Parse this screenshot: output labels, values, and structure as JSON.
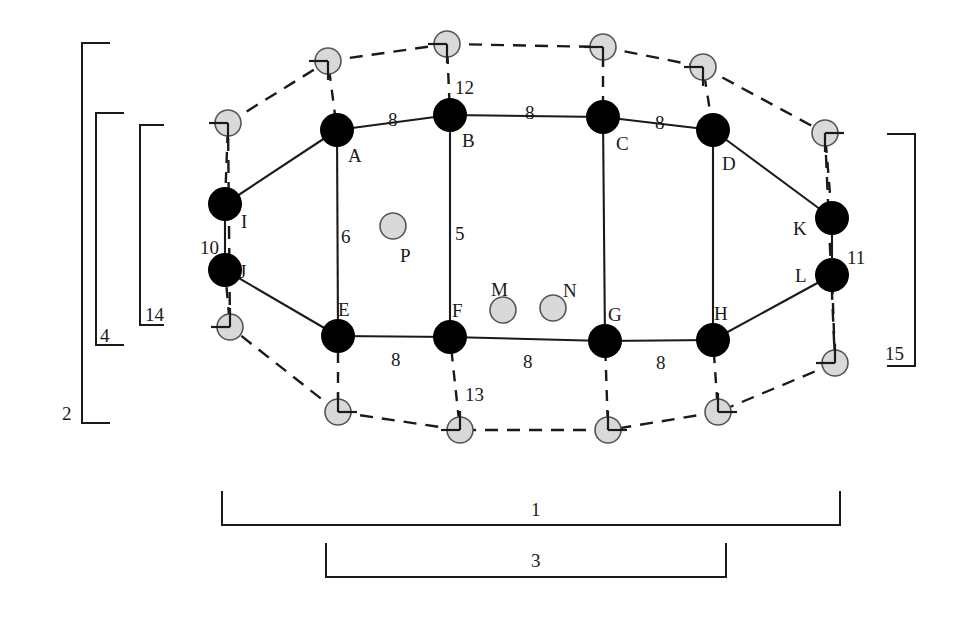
{
  "figure": {
    "type": "graph-diagram"
  },
  "nodes": {
    "solid": [
      {
        "id": "A",
        "label": "A",
        "x": 337,
        "y": 130,
        "label_x": 348,
        "label_y": 146
      },
      {
        "id": "B",
        "label": "B",
        "x": 450,
        "y": 115,
        "label_x": 462,
        "label_y": 131
      },
      {
        "id": "C",
        "label": "C",
        "x": 603,
        "y": 117,
        "label_x": 616,
        "label_y": 134
      },
      {
        "id": "D",
        "label": "D",
        "x": 713,
        "y": 130,
        "label_x": 722,
        "label_y": 154
      },
      {
        "id": "E",
        "label": "E",
        "x": 338,
        "y": 336,
        "label_x": 338,
        "label_y": 300
      },
      {
        "id": "F",
        "label": "F",
        "x": 450,
        "y": 337,
        "label_x": 452,
        "label_y": 301
      },
      {
        "id": "G",
        "label": "G",
        "x": 605,
        "y": 341,
        "label_x": 608,
        "label_y": 305
      },
      {
        "id": "H",
        "label": "H",
        "x": 713,
        "y": 340,
        "label_x": 714,
        "label_y": 304
      },
      {
        "id": "I",
        "label": "I",
        "x": 225,
        "y": 204,
        "label_x": 241,
        "label_y": 212
      },
      {
        "id": "J",
        "label": "J",
        "x": 225,
        "y": 270,
        "label_x": 239,
        "label_y": 262
      },
      {
        "id": "K",
        "label": "K",
        "x": 832,
        "y": 218,
        "label_x": 793,
        "label_y": 219
      },
      {
        "id": "L",
        "label": "L",
        "x": 832,
        "y": 275,
        "label_x": 795,
        "label_y": 266
      }
    ],
    "grey_plain": [
      {
        "id": "P",
        "label": "P",
        "x": 393,
        "y": 226,
        "label_x": 400,
        "label_y": 246
      },
      {
        "id": "M",
        "label": "M",
        "x": 503,
        "y": 310,
        "label_x": 491,
        "label_y": 280
      },
      {
        "id": "N",
        "label": "N",
        "x": 553,
        "y": 308,
        "label_x": 563,
        "label_y": 281
      }
    ],
    "grey_marker": [
      {
        "id": "m1",
        "x": 228,
        "y": 123,
        "tick": "down-left"
      },
      {
        "id": "m2",
        "x": 328,
        "y": 61,
        "tick": "down-left"
      },
      {
        "id": "m3",
        "x": 447,
        "y": 44,
        "tick": "down-left"
      },
      {
        "id": "m4",
        "x": 603,
        "y": 47,
        "tick": "down-left"
      },
      {
        "id": "m5",
        "x": 703,
        "y": 67,
        "tick": "down-left"
      },
      {
        "id": "m6",
        "x": 825,
        "y": 133,
        "tick": "down"
      },
      {
        "id": "m7",
        "x": 835,
        "y": 363,
        "tick": "up"
      },
      {
        "id": "m8",
        "x": 718,
        "y": 412,
        "tick": "up-right"
      },
      {
        "id": "m9",
        "x": 608,
        "y": 430,
        "tick": "up-right"
      },
      {
        "id": "m10",
        "x": 460,
        "y": 430,
        "tick": "up"
      },
      {
        "id": "m11",
        "x": 338,
        "y": 412,
        "tick": "up-right"
      },
      {
        "id": "m12",
        "x": 230,
        "y": 327,
        "tick": "up"
      }
    ]
  },
  "edges": {
    "solid": [
      [
        "A",
        "B"
      ],
      [
        "B",
        "C"
      ],
      [
        "C",
        "D"
      ],
      [
        "E",
        "F"
      ],
      [
        "F",
        "G"
      ],
      [
        "G",
        "H"
      ],
      [
        "A",
        "E"
      ],
      [
        "B",
        "F"
      ],
      [
        "C",
        "G"
      ],
      [
        "D",
        "H"
      ],
      [
        "I",
        "A"
      ],
      [
        "I",
        "J"
      ],
      [
        "J",
        "E"
      ],
      [
        "D",
        "K"
      ],
      [
        "K",
        "L"
      ],
      [
        "L",
        "H"
      ]
    ],
    "dashed_ring": [
      "m1",
      "m2",
      "m3",
      "m4",
      "m5",
      "m6",
      "m7",
      "m8",
      "m9",
      "m10",
      "m11",
      "m12"
    ],
    "dashed_spokes": [
      [
        "m1",
        "I"
      ],
      [
        "m2",
        "A"
      ],
      [
        "m3",
        "B"
      ],
      [
        "m4",
        "C"
      ],
      [
        "m5",
        "D"
      ],
      [
        "m6",
        "K"
      ],
      [
        "m7",
        "L"
      ],
      [
        "m8",
        "H"
      ],
      [
        "m9",
        "G"
      ],
      [
        "m10",
        "F"
      ],
      [
        "m11",
        "E"
      ],
      [
        "m12",
        "J"
      ]
    ]
  },
  "edge_labels": [
    {
      "text": "8",
      "x": 388,
      "y": 110,
      "for": "A-B"
    },
    {
      "text": "8",
      "x": 525,
      "y": 103,
      "for": "B-C"
    },
    {
      "text": "8",
      "x": 655,
      "y": 113,
      "for": "C-D"
    },
    {
      "text": "8",
      "x": 391,
      "y": 350,
      "for": "E-F"
    },
    {
      "text": "8",
      "x": 523,
      "y": 352,
      "for": "F-G"
    },
    {
      "text": "8",
      "x": 656,
      "y": 353,
      "for": "G-H"
    },
    {
      "text": "6",
      "x": 341,
      "y": 227,
      "for": "A-E"
    },
    {
      "text": "5",
      "x": 455,
      "y": 224,
      "for": "B-F"
    },
    {
      "text": "10",
      "x": 200,
      "y": 238,
      "for": "I-J"
    },
    {
      "text": "11",
      "x": 847,
      "y": 248,
      "for": "K-L"
    },
    {
      "text": "12",
      "x": 455,
      "y": 78,
      "for": "m3-B"
    },
    {
      "text": "13",
      "x": 465,
      "y": 385,
      "for": "m10-F"
    }
  ],
  "brackets": [
    {
      "id": "2",
      "label": "2",
      "orientation": "vertical-right",
      "x": 82,
      "y1": 43,
      "y2": 423,
      "arm": 28,
      "label_x": 62,
      "label_y": 404
    },
    {
      "id": "4",
      "label": "4",
      "orientation": "vertical-right",
      "x": 96,
      "y1": 113,
      "y2": 345,
      "arm": 28,
      "label_x": 100,
      "label_y": 326
    },
    {
      "id": "14",
      "label": "14",
      "orientation": "vertical-right",
      "x": 140,
      "y1": 125,
      "y2": 325,
      "arm": 24,
      "label_x": 145,
      "label_y": 305
    },
    {
      "id": "15",
      "label": "15",
      "orientation": "vertical-left",
      "x": 915,
      "y": 0,
      "y1": 134,
      "y2": 366,
      "arm": 28,
      "label_x": 885,
      "label_y": 344
    },
    {
      "id": "1",
      "label": "1",
      "orientation": "horizontal-up",
      "y": 525,
      "x1": 222,
      "x2": 840,
      "arm": 34,
      "label_x": 531,
      "label_y": 500
    },
    {
      "id": "3",
      "label": "3",
      "orientation": "horizontal-up",
      "y": 577,
      "x1": 326,
      "x2": 726,
      "arm": 34,
      "label_x": 531,
      "label_y": 551
    }
  ],
  "colors": {
    "solid_node_fill": "#000000",
    "grey_node_fill": "#d9d9d9",
    "grey_node_stroke": "#555555",
    "line": "#1a1a1a",
    "background": "#ffffff"
  }
}
